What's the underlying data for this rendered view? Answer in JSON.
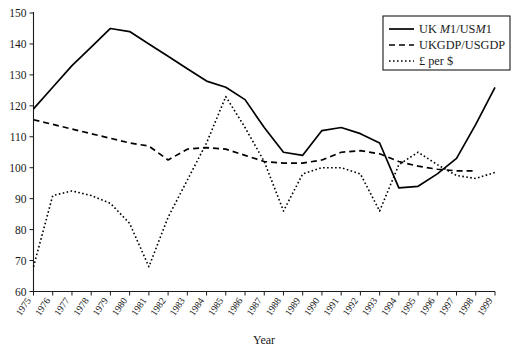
{
  "chart_data": {
    "type": "line",
    "title": "",
    "xlabel": "Year",
    "ylabel": "",
    "xlim": [
      1975,
      1999
    ],
    "ylim": [
      60,
      150
    ],
    "grid": false,
    "legend_position": "top-right",
    "x": [
      1975,
      1976,
      1977,
      1978,
      1979,
      1980,
      1981,
      1982,
      1983,
      1984,
      1985,
      1986,
      1987,
      1988,
      1989,
      1990,
      1991,
      1992,
      1993,
      1994,
      1995,
      1996,
      1997,
      1998,
      1999
    ],
    "yticks": [
      60,
      70,
      80,
      90,
      100,
      110,
      120,
      130,
      140,
      150
    ],
    "xticks": [
      "1975",
      "1976",
      "1977",
      "1978",
      "1979",
      "1980",
      "1981",
      "1982",
      "1983",
      "1984",
      "1985",
      "1986",
      "1987",
      "1988",
      "1989",
      "1990",
      "1991",
      "1992",
      "1993",
      "1994",
      "1995",
      "1996",
      "1997",
      "1998",
      "1999"
    ],
    "series": [
      {
        "name": "UK M1/USM1",
        "style": "solid",
        "values": [
          119,
          126,
          133,
          139,
          145,
          144,
          140,
          136,
          132,
          128,
          126,
          122,
          113,
          105,
          104,
          112,
          113,
          111,
          108,
          93.5,
          94,
          98,
          103,
          114,
          126
        ]
      },
      {
        "name": "UKGDP/USGDP",
        "style": "dashed",
        "values": [
          115.5,
          114,
          112.5,
          111,
          109.5,
          108,
          107,
          102.5,
          106,
          106.5,
          106,
          104,
          102,
          101.5,
          101.5,
          102.5,
          105,
          105.5,
          104.5,
          102,
          100.5,
          99.5,
          99,
          99,
          null
        ]
      },
      {
        "name": "£ per $",
        "style": "dotted",
        "values": [
          68,
          91,
          92.5,
          91,
          88.5,
          82,
          68,
          84,
          96,
          108,
          123,
          113,
          102,
          86,
          98,
          100,
          100,
          98,
          86,
          101,
          105,
          101,
          97.5,
          96.5,
          98.5
        ]
      }
    ]
  },
  "legend": {
    "entries": [
      {
        "label_plain": "UK M1/USM1",
        "label_prefix": "UK ",
        "label_italic1": "M",
        "label_mid": "1/US",
        "label_italic2": "M",
        "label_suffix": "1",
        "style": "solid"
      },
      {
        "label_plain": "UKGDP/USGDP",
        "style": "dashed"
      },
      {
        "label_plain": "£ per $",
        "style": "dotted"
      }
    ]
  },
  "axes": {
    "x_title": "Year"
  }
}
